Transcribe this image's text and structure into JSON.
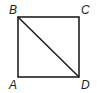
{
  "diagram": {
    "shape": "square",
    "vertices": {
      "top_left": "B",
      "top_right": "C",
      "bottom_left": "A",
      "bottom_right": "D"
    },
    "diagonal": "BD",
    "stroke_color": "#231f20"
  }
}
